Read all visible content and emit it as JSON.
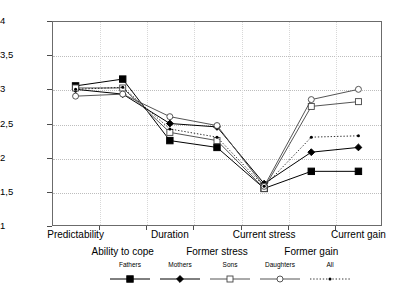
{
  "chart_data": {
    "type": "line",
    "title": "",
    "subtitle": "",
    "xlabel": "",
    "ylabel": "",
    "ylim": [
      1,
      4
    ],
    "yticks": [
      1,
      1.5,
      2,
      2.5,
      3,
      3.5,
      4
    ],
    "ytick_labels": [
      "1",
      "1,5",
      "2",
      "2,5",
      "3",
      "3,5",
      "4"
    ],
    "grid": true,
    "legend_position": "bottom",
    "categories": [
      "Predictability",
      "Ability to cope",
      "Duration",
      "Former stress",
      "Current stress",
      "Former gain",
      "Current gain"
    ],
    "category_rows": [
      0,
      1,
      0,
      1,
      0,
      1,
      0
    ],
    "series": [
      {
        "name": "Fathers",
        "marker": "filled-square",
        "line": "solid",
        "color": "#000000",
        "values": [
          3.05,
          3.15,
          2.25,
          2.15,
          1.55,
          1.8,
          1.8
        ]
      },
      {
        "name": "Mothers",
        "marker": "filled-diamond",
        "line": "solid",
        "color": "#000000",
        "values": [
          3.0,
          2.93,
          2.5,
          2.45,
          1.62,
          2.08,
          2.15
        ]
      },
      {
        "name": "Sons",
        "marker": "open-square",
        "line": "solid",
        "color": "#555555",
        "values": [
          3.02,
          3.02,
          2.37,
          2.25,
          1.55,
          2.75,
          2.82
        ]
      },
      {
        "name": "Daughters",
        "marker": "open-circle",
        "line": "solid",
        "color": "#555555",
        "values": [
          2.9,
          2.93,
          2.6,
          2.47,
          1.58,
          2.85,
          3.0
        ]
      },
      {
        "name": "All",
        "marker": "small-dot",
        "line": "dotted",
        "color": "#000000",
        "values": [
          3.0,
          3.03,
          2.42,
          2.3,
          1.58,
          2.3,
          2.32
        ]
      }
    ]
  },
  "legend": {
    "items": [
      {
        "label": "Fathers"
      },
      {
        "label": "Mothers"
      },
      {
        "label": "Sons"
      },
      {
        "label": "Daughters"
      },
      {
        "label": "All"
      }
    ]
  }
}
